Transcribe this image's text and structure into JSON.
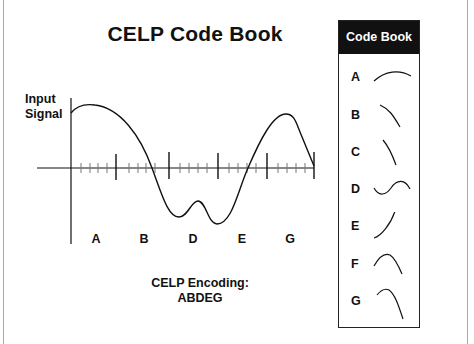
{
  "title": "CELP Code Book",
  "y_axis_label": [
    "Input",
    "Signal"
  ],
  "segment_labels": [
    {
      "label": "A",
      "x": 96
    },
    {
      "label": "B",
      "x": 144
    },
    {
      "label": "D",
      "x": 193
    },
    {
      "label": "E",
      "x": 242
    },
    {
      "label": "G",
      "x": 290
    }
  ],
  "encoding": {
    "label": "CELP Encoding:",
    "value": "ABDEG"
  },
  "codebook": {
    "header": "Code Book",
    "entries": [
      {
        "letter": "A"
      },
      {
        "letter": "B"
      },
      {
        "letter": "C"
      },
      {
        "letter": "D"
      },
      {
        "letter": "E"
      },
      {
        "letter": "F"
      },
      {
        "letter": "G"
      }
    ]
  },
  "colors": {
    "ink": "#111111",
    "header_bg": "#111111",
    "header_text": "#ffffff",
    "frame": "#aaaaaa"
  }
}
